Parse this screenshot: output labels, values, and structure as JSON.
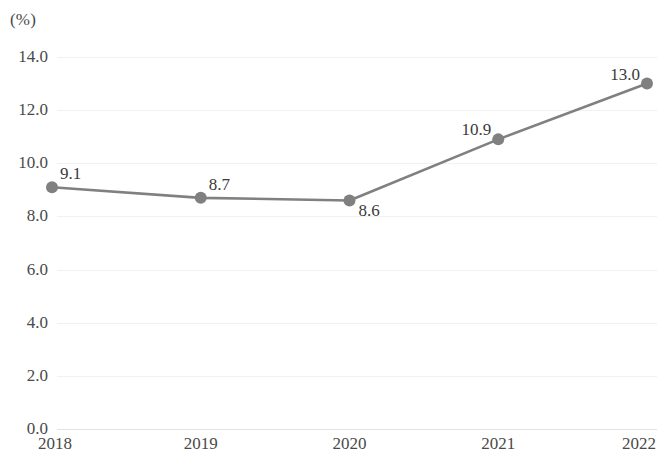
{
  "chart_data": {
    "type": "line",
    "title": "",
    "subtitle": "",
    "xlabel": "",
    "ylabel": "",
    "unit_label": "(%)",
    "categories": [
      "2018",
      "2019",
      "2020",
      "2021",
      "2022"
    ],
    "values": [
      9.1,
      8.7,
      8.6,
      10.9,
      13.0
    ],
    "point_labels": [
      "9.1",
      "8.7",
      "8.6",
      "10.9",
      "13.0"
    ],
    "series": [
      {
        "name": "",
        "values": [
          9.1,
          8.7,
          8.6,
          10.9,
          13.0
        ]
      }
    ],
    "ylim": [
      0.0,
      14.0
    ],
    "ytick_labels": [
      "0.0",
      "2.0",
      "4.0",
      "6.0",
      "8.0",
      "10.0",
      "12.0",
      "14.0"
    ],
    "ytick_values": [
      0.0,
      2.0,
      4.0,
      6.0,
      8.0,
      10.0,
      12.0,
      14.0
    ],
    "grid": true,
    "legend": false,
    "legend_position": "none",
    "line_color": "#808080",
    "marker_color": "#808080",
    "grid_color": "#f1f1f1",
    "axis_color": "#e3e3e3",
    "text_color": "#3a3a3a",
    "label_placement": [
      "above-right",
      "above-right",
      "below-right",
      "left",
      "left"
    ]
  }
}
